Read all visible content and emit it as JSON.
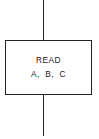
{
  "diagram": {
    "type": "flowchart-process-block",
    "block": {
      "shape": "rectangle",
      "lines": [
        "READ",
        "A, B, C"
      ]
    },
    "connectors": {
      "incoming": "top",
      "outgoing": "bottom"
    },
    "colors": {
      "stroke": "#222222",
      "background": "#ffffff",
      "text": "#222222"
    }
  }
}
